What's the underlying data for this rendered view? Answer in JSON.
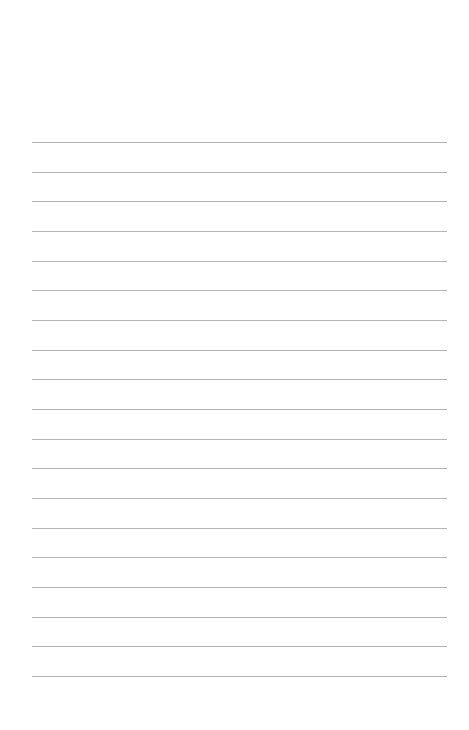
{
  "page": {
    "type": "lined-paper",
    "background_color": "#ffffff",
    "line_color": "#b4b4b4",
    "line_count": 19,
    "first_line_y": 142,
    "line_spacing": 29.67,
    "line_left": 32,
    "line_right": 447
  }
}
